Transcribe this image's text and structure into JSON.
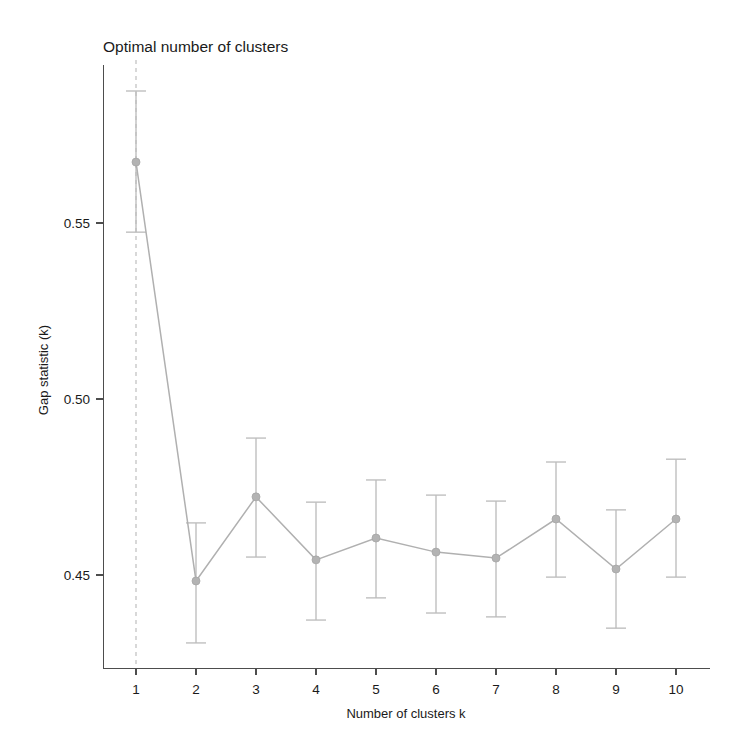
{
  "chart_data": {
    "type": "line",
    "title": "Optimal number of clusters",
    "xlabel": "Number of clusters k",
    "ylabel": "Gap statistic (k)",
    "categories": [
      "1",
      "2",
      "3",
      "4",
      "5",
      "6",
      "7",
      "8",
      "9",
      "10"
    ],
    "x": [
      1,
      2,
      3,
      4,
      5,
      6,
      7,
      8,
      9,
      10
    ],
    "values": [
      0.5673,
      0.4483,
      0.4722,
      0.4543,
      0.4605,
      0.4565,
      0.4548,
      0.4659,
      0.4517,
      0.4659
    ],
    "error_upper": [
      0.5875,
      0.4648,
      0.4889,
      0.4707,
      0.477,
      0.4727,
      0.471,
      0.4821,
      0.4685,
      0.4829
    ],
    "error_lower": [
      0.5474,
      0.4307,
      0.4551,
      0.4372,
      0.4435,
      0.4392,
      0.4381,
      0.4494,
      0.4349,
      0.4494
    ],
    "xlim": [
      0.55,
      10.6
    ],
    "ylim": [
      0.4225,
      0.5938
    ],
    "ytick_values": [
      0.45,
      0.5,
      0.55
    ],
    "ytick_labels": [
      "0.45",
      "0.50",
      "0.55"
    ],
    "xtick_values": [
      1,
      2,
      3,
      4,
      5,
      6,
      7,
      8,
      9,
      10
    ],
    "xtick_labels": [
      "1",
      "2",
      "3",
      "4",
      "5",
      "6",
      "7",
      "8",
      "9",
      "10"
    ],
    "grid": false,
    "legend": "none",
    "annotations": [
      {
        "name": "optimal-k-vline",
        "type": "vline",
        "x": 1,
        "style": "dashed",
        "color": "#bfbfbf"
      }
    ],
    "colors": {
      "line": "#b0b0b0",
      "marker": "#b3b3b3",
      "errorbar": "#bdbdbd",
      "axis": "#4d4d4d",
      "vline": "#bfbfbf",
      "text": "#1a1a1a",
      "background": "#ffffff"
    }
  }
}
